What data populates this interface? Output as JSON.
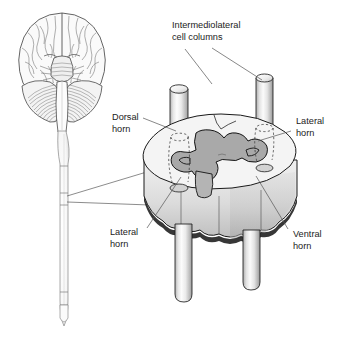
{
  "figure": {
    "name": "spinal-cord-gray-matter-diagram",
    "background_color": "#ffffff",
    "width": 347,
    "height": 344
  },
  "palette": {
    "ink": "#1a1a1a",
    "leader_line": "#555555",
    "text": "#222222",
    "white_matter": "#f2f2f2",
    "gray_matter": "#a9a9a9",
    "gray_matter_edge": "#1a1a1a",
    "cylinder_light": "#fbfbfb",
    "cylinder_mid": "#d8d8d8",
    "cylinder_dark": "#9a9a9a",
    "disc_top": "#f4f4f4",
    "disc_side": "#dcdcdc",
    "disc_side_shadow": "#c2c2c2",
    "shadow": "#111111",
    "brain_fill": "#fafafa",
    "brain_line": "#4a4a4a",
    "cerebellum_line": "#6a6a6a",
    "cord_fill": "#fcfcfc",
    "cord_line": "#8a8a8a"
  },
  "labels": [
    {
      "id": "intermediolateral-cell-columns",
      "lines": [
        "Intermediolateral",
        "cell columns"
      ],
      "x": 172,
      "y": 36,
      "anchor": "start",
      "leaders": [
        {
          "points": "185,49 212,84"
        },
        {
          "points": "212,48 262,80"
        }
      ]
    },
    {
      "id": "dorsal-horn",
      "lines": [
        "Dorsal",
        "horn"
      ],
      "x": 112,
      "y": 120,
      "anchor": "start",
      "leaders": [
        {
          "points": "143,118 176,131"
        }
      ]
    },
    {
      "id": "lateral-horn-right",
      "lines": [
        "Lateral",
        "horn"
      ],
      "x": 293,
      "y": 122,
      "anchor": "start",
      "leaders": [
        {
          "points": "291,131 258,141"
        }
      ]
    },
    {
      "id": "lateral-horn-left",
      "lines": [
        "Lateral",
        "horn"
      ],
      "x": 110,
      "y": 233,
      "anchor": "start",
      "leaders": [
        {
          "points": "147,228 181,177"
        }
      ]
    },
    {
      "id": "ventral-horn",
      "lines": [
        "Ventral",
        "horn"
      ],
      "x": 291,
      "y": 235,
      "anchor": "start",
      "leaders": [
        {
          "points": "288,229 256,176"
        }
      ]
    }
  ],
  "callout": {
    "id": "magnification-callout",
    "description": "lines from spinal cord segment to cross-section disc",
    "leaders": [
      {
        "points": "67,196 150,171"
      },
      {
        "points": "67,202 150,205"
      }
    ],
    "segment_marks": [
      {
        "y1": 193,
        "y2": 193
      },
      {
        "y1": 205,
        "y2": 205
      }
    ]
  },
  "brain": {
    "id": "brain-inferior-view",
    "description": "inferior view of brain with cerebral hemispheres, brainstem and cerebellum",
    "center_x": 62,
    "top_y": 12
  },
  "spinal_cord": {
    "id": "spinal-cord",
    "description": "spinal cord descending from medulla to conus medullaris",
    "top_y": 96,
    "bottom_y": 332,
    "center_x": 64
  },
  "cross_section": {
    "id": "spinal-cord-cross-section-disc",
    "description": "three-dimensional slab of spinal cord showing butterfly shaped gray matter",
    "columns": [
      {
        "id": "column-rear-left",
        "position": "rear-left"
      },
      {
        "id": "column-rear-right",
        "position": "rear-right"
      },
      {
        "id": "column-front-left",
        "position": "front-left"
      },
      {
        "id": "column-front-right",
        "position": "front-right"
      }
    ]
  }
}
